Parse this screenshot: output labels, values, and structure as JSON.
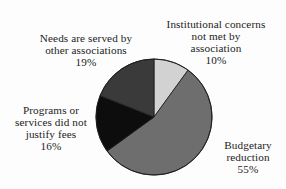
{
  "chart_data": {
    "type": "pie",
    "title": "",
    "subtitle": "",
    "xlabel": "",
    "ylabel": "",
    "legend_position": "none",
    "grid": false,
    "start_angle_deg": 0,
    "direction": "clockwise",
    "categories": [
      "Institutional concerns not met by association",
      "Budgetary reduction",
      "Programs or services did not justify fees",
      "Needs are served by other associations"
    ],
    "values": [
      10,
      55,
      16,
      19
    ],
    "value_labels": [
      "10%",
      "55%",
      "16%",
      "19%"
    ],
    "colors": [
      "#d2d2d2",
      "#6e6e6e",
      "#0d0d0d",
      "#3a3a3a"
    ],
    "slices": [
      {
        "label": "Institutional concerns not met by association",
        "value": 10,
        "value_label": "10%",
        "color": "#d2d2d2",
        "start_deg": 0,
        "end_deg": 36
      },
      {
        "label": "Budgetary reduction",
        "value": 55,
        "value_label": "55%",
        "color": "#6e6e6e",
        "start_deg": 36,
        "end_deg": 234
      },
      {
        "label": "Programs or services did not justify fees",
        "value": 16,
        "value_label": "16%",
        "color": "#0d0d0d",
        "start_deg": 234,
        "end_deg": 291.6
      },
      {
        "label": "Needs are served by other associations",
        "value": 19,
        "value_label": "19%",
        "color": "#3a3a3a",
        "start_deg": 291.6,
        "end_deg": 360
      }
    ]
  },
  "labels": {
    "institutional": {
      "text": "Institutional concerns\nnot met by\nassociation",
      "percent": "10%"
    },
    "needs": {
      "text": "Needs are served by\nother associations",
      "percent": "19%"
    },
    "programs": {
      "text": "Programs or\nservices did not\njustify fees",
      "percent": "16%"
    },
    "budgetary": {
      "text": "Budgetary\nreduction",
      "percent": "55%"
    }
  },
  "style": {
    "background": "#fdfdfd",
    "text_color": "#1c1c1c",
    "outline_color": "#1a1a1a"
  }
}
